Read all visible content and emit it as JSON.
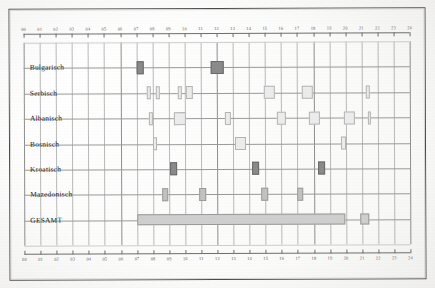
{
  "chart_data": {
    "type": "bar",
    "title": "",
    "xlabel": "",
    "ylabel": "",
    "orientation": "horizontal-timeline",
    "xlim": [
      0,
      24
    ],
    "x_tick_labels": [
      "00",
      "01",
      "02",
      "03",
      "04",
      "05",
      "06",
      "07",
      "08",
      "09",
      "10",
      "11",
      "12",
      "13",
      "14",
      "15",
      "16",
      "17",
      "18",
      "19",
      "20",
      "21",
      "22",
      "23",
      "24"
    ],
    "axis_position": "both-top-and-bottom",
    "grid": true,
    "legend": "none",
    "categories": [
      "Bulgarisch",
      "Serbisch",
      "Albanisch",
      "Bosnisch",
      "Kroatisch",
      "Mazedonisch",
      "GESAMT"
    ],
    "series": [
      {
        "name": "Bulgarisch",
        "shade": "dark",
        "intervals": [
          {
            "start": 7.0,
            "end": 7.45
          },
          {
            "start": 11.6,
            "end": 12.45
          }
        ]
      },
      {
        "name": "Serbisch",
        "shade": "light",
        "intervals": [
          {
            "start": 7.65,
            "end": 7.9
          },
          {
            "start": 8.2,
            "end": 8.45
          },
          {
            "start": 9.55,
            "end": 9.8
          },
          {
            "start": 10.1,
            "end": 10.5
          },
          {
            "start": 14.9,
            "end": 15.6
          },
          {
            "start": 17.3,
            "end": 18.0
          },
          {
            "start": 21.25,
            "end": 21.5
          }
        ]
      },
      {
        "name": "Albanisch",
        "shade": "light",
        "intervals": [
          {
            "start": 7.8,
            "end": 8.05
          },
          {
            "start": 9.3,
            "end": 10.1
          },
          {
            "start": 12.5,
            "end": 12.85
          },
          {
            "start": 15.7,
            "end": 16.3
          },
          {
            "start": 17.7,
            "end": 18.4
          },
          {
            "start": 19.9,
            "end": 20.6
          },
          {
            "start": 21.4,
            "end": 21.6
          }
        ]
      },
      {
        "name": "Bosnisch",
        "shade": "light",
        "intervals": [
          {
            "start": 8.05,
            "end": 8.25
          },
          {
            "start": 13.1,
            "end": 13.8
          },
          {
            "start": 19.7,
            "end": 20.0
          }
        ]
      },
      {
        "name": "Kroatisch",
        "shade": "dark",
        "intervals": [
          {
            "start": 9.1,
            "end": 9.5
          },
          {
            "start": 14.2,
            "end": 14.6
          },
          {
            "start": 18.3,
            "end": 18.7
          }
        ]
      },
      {
        "name": "Mazedonisch",
        "shade": "mid",
        "intervals": [
          {
            "start": 8.6,
            "end": 8.95
          },
          {
            "start": 10.9,
            "end": 11.3
          },
          {
            "start": 14.75,
            "end": 15.15
          },
          {
            "start": 17.0,
            "end": 17.35
          }
        ]
      },
      {
        "name": "GESAMT",
        "shade": "total",
        "intervals": [
          {
            "start": 7.0,
            "end": 19.95
          },
          {
            "start": 20.9,
            "end": 21.45
          }
        ]
      }
    ]
  }
}
